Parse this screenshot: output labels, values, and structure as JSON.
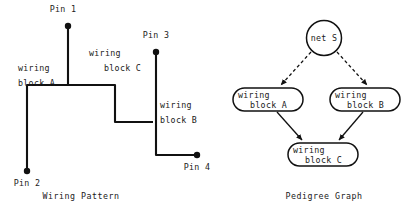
{
  "figure": {
    "title": "",
    "panels": [
      {
        "id": "wiring-pattern",
        "caption": "Wiring Pattern",
        "caption_x": 81,
        "caption_y": 199,
        "pins": [
          {
            "label": "Pin 1",
            "dot_x": 68,
            "dot_y": 26,
            "label_x": 63,
            "label_y": 12,
            "anchor": "middle"
          },
          {
            "label": "Pin 2",
            "dot_x": 27,
            "dot_y": 171,
            "label_x": 27,
            "label_y": 186,
            "anchor": "middle"
          },
          {
            "label": "Pin 3",
            "dot_x": 156,
            "dot_y": 52,
            "label_x": 156,
            "label_y": 38,
            "anchor": "middle"
          },
          {
            "label": "Pin 4",
            "dot_x": 197,
            "dot_y": 155,
            "label_x": 197,
            "label_y": 170,
            "anchor": "middle"
          }
        ],
        "wires": [
          {
            "name": "wire-pin1-to-pin2",
            "path": "M 68 26 L 68 85 L 27 85 L 27 171"
          },
          {
            "name": "wire-block-c-segment",
            "path": "M 68 85 L 115 85 L 115 122 L 153 122"
          },
          {
            "name": "wire-pin3-to-pin4",
            "path": "M 156 52 L 156 155 L 197 155"
          }
        ],
        "labels": [
          {
            "name": "wiring-block-a-label",
            "line1": "wiring",
            "line2": "block A",
            "x1": 18,
            "y1": 71,
            "x2": 18,
            "y2": 86
          },
          {
            "name": "wiring-block-c-label",
            "line1": "wiring",
            "line2": "block C",
            "x1": 89,
            "y1": 56,
            "x2": 104,
            "y2": 71
          },
          {
            "name": "wiring-block-b-label",
            "line1": "wiring",
            "line2": "block B",
            "x1": 160,
            "y1": 108,
            "x2": 160,
            "y2": 123
          }
        ]
      },
      {
        "id": "pedigree-graph",
        "caption": "Pedigree Graph",
        "caption_x": 324,
        "caption_y": 199,
        "root": {
          "name": "net-s-node",
          "label": "net S",
          "cx": 324,
          "cy": 38,
          "r": 17.5,
          "text_x": 324,
          "text_y": 41
        },
        "nodes": [
          {
            "name": "node-wiring-block-a",
            "line1": "wiring",
            "line2": "block A",
            "x": 233,
            "y": 88,
            "w": 70,
            "h": 23,
            "rx": 11.5,
            "t1x": 238,
            "t1y": 98,
            "t2x": 250,
            "t2y": 108
          },
          {
            "name": "node-wiring-block-b",
            "line1": "wiring",
            "line2": "block B",
            "x": 330,
            "y": 88,
            "w": 70,
            "h": 23,
            "rx": 11.5,
            "t1x": 335,
            "t1y": 98,
            "t2x": 347,
            "t2y": 108
          },
          {
            "name": "node-wiring-block-c",
            "line1": "wiring",
            "line2": "block C",
            "x": 288,
            "y": 143,
            "w": 70,
            "h": 23,
            "rx": 11.5,
            "t1x": 293,
            "t1y": 153,
            "t2x": 305,
            "t2y": 163
          }
        ],
        "edges": [
          {
            "name": "edge-net-s-to-block-a",
            "style": "dashed",
            "path": "M 311 52 L 281 85"
          },
          {
            "name": "edge-net-s-to-block-b",
            "style": "dashed",
            "path": "M 337 52 L 367 85"
          },
          {
            "name": "edge-block-a-to-block-c",
            "style": "solid",
            "path": "M 277 112 L 302 140"
          },
          {
            "name": "edge-block-b-to-block-c",
            "style": "solid",
            "path": "M 363 112 L 339 140"
          }
        ]
      }
    ]
  }
}
